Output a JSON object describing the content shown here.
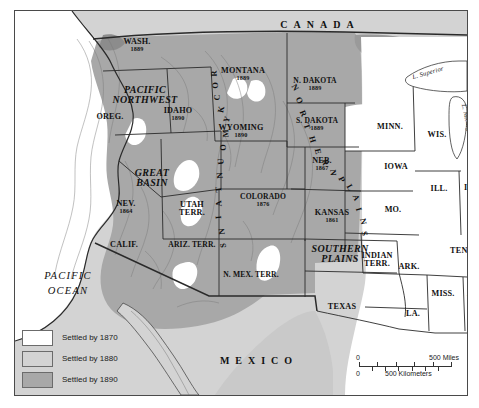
{
  "map": {
    "title": "Western United States Settlement 1870-1890",
    "countries": [
      {
        "name": "CANADA",
        "x": 305,
        "y": 14
      },
      {
        "name": "MEXICO",
        "x": 244,
        "y": 350
      }
    ],
    "ocean_label": {
      "line1": "PACIFIC",
      "line2": "OCEAN",
      "x": 53,
      "y": 272
    },
    "lakes": [
      {
        "name": "L. Superior",
        "x": 413,
        "y": 62,
        "rotate": -16
      },
      {
        "name": "L. Michigan",
        "x": 452,
        "y": 110,
        "rotate": 78
      }
    ],
    "regions": [
      {
        "name": "PACIFIC NORTHWEST",
        "lines": [
          "PACIFIC",
          "NORTHWEST"
        ],
        "x": 130,
        "y": 84
      },
      {
        "name": "GREAT BASIN",
        "lines": [
          "GREAT",
          "BASIN"
        ],
        "x": 137,
        "y": 167
      },
      {
        "name": "SOUTHERN PLAINS",
        "lines": [
          "SOUTHERN",
          "PLAINS"
        ],
        "x": 325,
        "y": 243
      },
      {
        "name": "ROCKY MOUNTAINS",
        "curved": "ROCKYMOUNTAINS"
      },
      {
        "name": "NORTHERN PLAINS",
        "curved": "NORTHERNPLAINS"
      }
    ],
    "states": [
      {
        "label": "WASH.",
        "year": "1889",
        "x": 122,
        "y": 34
      },
      {
        "label": "MONTANA",
        "year": "1889",
        "x": 228,
        "y": 63
      },
      {
        "label": "N. DAKOTA",
        "year": "1889",
        "x": 300,
        "y": 73
      },
      {
        "label": "OREG.",
        "year": "",
        "x": 95,
        "y": 106
      },
      {
        "label": "IDAHO",
        "year": "1890",
        "x": 163,
        "y": 103
      },
      {
        "label": "S. DAKOTA",
        "year": "1889",
        "x": 302,
        "y": 113
      },
      {
        "label": "MINN.",
        "year": "",
        "x": 375,
        "y": 116
      },
      {
        "label": "WIS.",
        "year": "",
        "x": 422,
        "y": 124
      },
      {
        "label": "WYOMING",
        "year": "1890",
        "x": 226,
        "y": 120
      },
      {
        "label": "NEB.",
        "year": "1867",
        "x": 307,
        "y": 153
      },
      {
        "label": "IOWA",
        "year": "",
        "x": 381,
        "y": 156
      },
      {
        "label": "NEV.",
        "year": "1864",
        "x": 111,
        "y": 196
      },
      {
        "label": "UTAH",
        "year": "",
        "x": 177,
        "y": 198,
        "line2": "TERR."
      },
      {
        "label": "COLORADO",
        "year": "1876",
        "x": 248,
        "y": 189
      },
      {
        "label": "KANSAS",
        "year": "1861",
        "x": 317,
        "y": 205
      },
      {
        "label": "MO.",
        "year": "",
        "x": 378,
        "y": 199
      },
      {
        "label": "ILL.",
        "year": "",
        "x": 424,
        "y": 178
      },
      {
        "label": "IND.",
        "year": "",
        "x": 458,
        "y": 177
      },
      {
        "label": "CALIF.",
        "year": "",
        "x": 109,
        "y": 234
      },
      {
        "label": "ARIZ. TERR.",
        "year": "",
        "x": 177,
        "y": 234
      },
      {
        "label": "INDIAN",
        "year": "",
        "x": 362,
        "y": 249,
        "line2": "TERR."
      },
      {
        "label": "TENN.",
        "year": "",
        "x": 448,
        "y": 240
      },
      {
        "label": "ARK.",
        "year": "",
        "x": 394,
        "y": 256
      },
      {
        "label": "N. MEX. TERR.",
        "year": "",
        "x": 236,
        "y": 264
      },
      {
        "label": "MISS.",
        "year": "",
        "x": 428,
        "y": 283
      },
      {
        "label": "ALA.",
        "year": "",
        "x": 462,
        "y": 283
      },
      {
        "label": "TEXAS",
        "year": "",
        "x": 327,
        "y": 296
      },
      {
        "label": "LA.",
        "year": "",
        "x": 398,
        "y": 303
      }
    ]
  },
  "legend": {
    "items": [
      {
        "label": "Settled by 1870",
        "color": "#ffffff"
      },
      {
        "label": "Settled by 1880",
        "color": "#d3d3d3"
      },
      {
        "label": "Settled by 1890",
        "color": "#a8a8a8"
      }
    ]
  },
  "scale": {
    "zero_top": "0",
    "zero_bottom": "0",
    "miles_label": "500 Miles",
    "kilometers_label": "500 Kilometers",
    "miles_ticks": 5,
    "kilometers_ticks": 7
  },
  "colors": {
    "settled_1870": "#ffffff",
    "settled_1880": "#d3d3d3",
    "settled_1890": "#a8a8a8",
    "border": "#4a4a4a",
    "ink": "#111111"
  }
}
